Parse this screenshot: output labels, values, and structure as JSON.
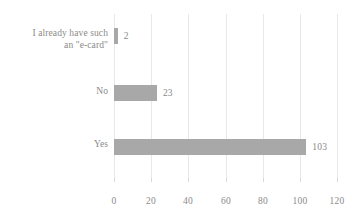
{
  "chart_data": {
    "type": "bar",
    "orientation": "horizontal",
    "title": "",
    "subtitle": "",
    "xlabel": "",
    "ylabel": "",
    "categories": [
      "I already have such an \"e-card\"",
      "No",
      "Yes"
    ],
    "category_lines": [
      [
        "I already have such",
        "an \"e-card\""
      ],
      [
        "No"
      ],
      [
        "Yes"
      ]
    ],
    "values": [
      2,
      23,
      103
    ],
    "data_labels": [
      "2",
      "23",
      "103"
    ],
    "xlim": [
      0,
      120
    ],
    "xticks": [
      0,
      20,
      40,
      60,
      80,
      100,
      120
    ],
    "xtick_labels": [
      "0",
      "20",
      "40",
      "60",
      "80",
      "100",
      "120"
    ],
    "grid": true,
    "grid_axis": "x",
    "legend": false,
    "legend_position": "none",
    "series": [
      {
        "name": "",
        "values": [
          2,
          23,
          103
        ]
      }
    ]
  },
  "style": {
    "bar_color": "#a8a8a8",
    "text_color": "#8a8a8a",
    "grid_color": "#e8e8e8",
    "background_color": "#ffffff"
  }
}
